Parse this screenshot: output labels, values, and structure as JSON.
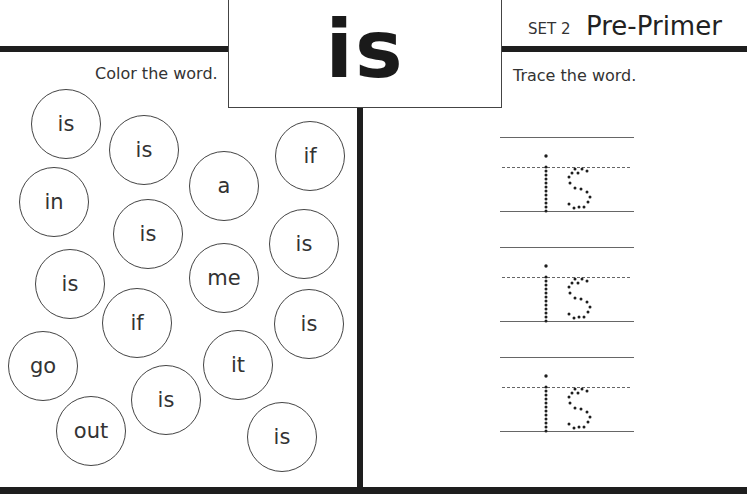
{
  "header": {
    "word": "is",
    "set_label": "SET 2",
    "level_label": "Pre-Primer"
  },
  "left_panel": {
    "instruction": "Color the word.",
    "circles": [
      {
        "word": "is",
        "x": 66,
        "y": 124
      },
      {
        "word": "is",
        "x": 144,
        "y": 150
      },
      {
        "word": "a",
        "x": 224,
        "y": 186
      },
      {
        "word": "if",
        "x": 310,
        "y": 156
      },
      {
        "word": "in",
        "x": 54,
        "y": 202
      },
      {
        "word": "is",
        "x": 148,
        "y": 234
      },
      {
        "word": "is",
        "x": 304,
        "y": 244
      },
      {
        "word": "is",
        "x": 70,
        "y": 284
      },
      {
        "word": "me",
        "x": 224,
        "y": 278
      },
      {
        "word": "if",
        "x": 137,
        "y": 323
      },
      {
        "word": "is",
        "x": 309,
        "y": 324
      },
      {
        "word": "go",
        "x": 43,
        "y": 366
      },
      {
        "word": "it",
        "x": 238,
        "y": 365
      },
      {
        "word": "is",
        "x": 166,
        "y": 400
      },
      {
        "word": "out",
        "x": 91,
        "y": 431
      },
      {
        "word": "is",
        "x": 282,
        "y": 437
      }
    ]
  },
  "right_panel": {
    "instruction": "Trace the word.",
    "trace_rows": [
      {
        "word": "is",
        "top": 137
      },
      {
        "word": "is",
        "top": 247
      },
      {
        "word": "is",
        "top": 357
      }
    ]
  },
  "colors": {
    "ink": "#1e1e1e",
    "outline": "#444444",
    "background": "#ffffff"
  }
}
